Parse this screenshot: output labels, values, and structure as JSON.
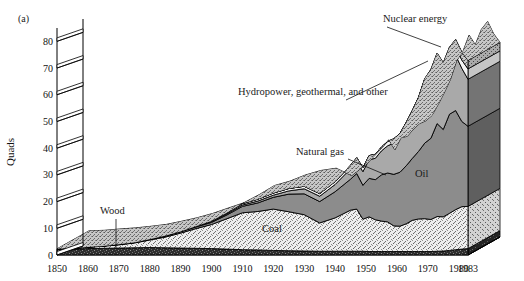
{
  "figure": {
    "panel_label": "(a)",
    "y_axis_title": "Quads",
    "background": "#ffffff",
    "ink": "#000000"
  },
  "chart_data": {
    "type": "area",
    "stacked": true,
    "title": "",
    "subtitle": "",
    "xlabel": "",
    "ylabel": "Quads",
    "xlim": [
      1850,
      1983
    ],
    "ylim": [
      0,
      85
    ],
    "ytick_values": [
      0,
      10,
      20,
      30,
      40,
      50,
      60,
      70,
      80
    ],
    "ytick_labels": [
      "0",
      "10",
      "20",
      "30",
      "40",
      "50",
      "60",
      "70",
      "80"
    ],
    "xtick_values": [
      1850,
      1860,
      1870,
      1880,
      1890,
      1900,
      1910,
      1920,
      1930,
      1940,
      1950,
      1960,
      1970,
      1980,
      1983
    ],
    "xtick_labels": [
      "1850",
      "1860",
      "1870",
      "1880",
      "1890",
      "1900",
      "1910",
      "1920",
      "1930",
      "1940",
      "1950",
      "1960",
      "1970",
      "1980",
      "1983"
    ],
    "grid": false,
    "legend_position": "inline-annotations",
    "projection": "3d-extruded-ribbon",
    "x": [
      1850,
      1855,
      1860,
      1865,
      1870,
      1875,
      1880,
      1885,
      1890,
      1895,
      1900,
      1905,
      1910,
      1915,
      1920,
      1925,
      1930,
      1935,
      1940,
      1945,
      1947,
      1949,
      1951,
      1953,
      1955,
      1957,
      1959,
      1961,
      1963,
      1965,
      1967,
      1969,
      1971,
      1973,
      1975,
      1977,
      1979,
      1981,
      1983
    ],
    "series": [
      {
        "name": "Wood",
        "fill": "#3a3a3a",
        "texture": "dark-fine-speckle",
        "values": [
          2.1,
          2.2,
          2.4,
          2.5,
          2.6,
          2.7,
          2.8,
          2.7,
          2.6,
          2.5,
          2.4,
          2.2,
          2.0,
          1.9,
          1.7,
          1.6,
          1.5,
          1.4,
          1.4,
          1.4,
          1.4,
          1.4,
          1.3,
          1.3,
          1.3,
          1.3,
          1.3,
          1.3,
          1.3,
          1.3,
          1.3,
          1.3,
          1.3,
          1.4,
          1.5,
          1.7,
          2.0,
          2.2,
          2.4
        ]
      },
      {
        "name": "Coal",
        "fill": "#e3e3e3",
        "texture": "light-stipple",
        "values": [
          0.2,
          0.3,
          0.5,
          0.8,
          1.2,
          1.8,
          2.8,
          4.0,
          5.6,
          7.4,
          9.0,
          11.4,
          13.8,
          14.4,
          15.5,
          14.6,
          13.6,
          10.6,
          12.5,
          15.4,
          15.8,
          12.0,
          13.0,
          11.9,
          11.4,
          11.1,
          9.6,
          9.5,
          10.4,
          11.7,
          12.2,
          12.3,
          12.0,
          13.0,
          12.8,
          13.9,
          15.0,
          15.9,
          15.8
        ]
      },
      {
        "name": "Oil",
        "fill": "#8c8c8c",
        "texture": "solid-mid-gray",
        "values": [
          0.0,
          0.0,
          0.1,
          0.1,
          0.2,
          0.2,
          0.3,
          0.4,
          0.5,
          0.6,
          0.8,
          1.4,
          2.4,
          3.2,
          4.4,
          6.6,
          7.8,
          8.0,
          9.8,
          11.6,
          13.3,
          12.7,
          14.4,
          15.0,
          17.3,
          18.3,
          19.3,
          20.2,
          21.7,
          23.2,
          25.3,
          28.3,
          30.4,
          34.8,
          32.7,
          37.1,
          37.1,
          31.9,
          30.0
        ]
      },
      {
        "name": "Natural gas",
        "fill": "#a9a9a9",
        "texture": "solid-light-gray",
        "values": [
          0.0,
          0.0,
          0.0,
          0.0,
          0.0,
          0.0,
          0.0,
          0.1,
          0.1,
          0.2,
          0.3,
          0.4,
          0.5,
          0.7,
          0.8,
          1.2,
          1.9,
          2.0,
          2.7,
          3.9,
          4.5,
          5.1,
          7.0,
          8.0,
          9.0,
          10.2,
          11.7,
          12.9,
          14.4,
          15.8,
          17.9,
          21.3,
          22.5,
          22.5,
          19.9,
          19.9,
          20.7,
          19.9,
          17.6
        ]
      },
      {
        "name": "Hydropower, geothermal, and other",
        "fill": "#f2f2f2",
        "texture": "near-white",
        "values": [
          0.0,
          0.0,
          0.0,
          0.0,
          0.0,
          0.0,
          0.0,
          0.0,
          0.0,
          0.1,
          0.25,
          0.4,
          0.55,
          0.7,
          0.8,
          0.9,
          0.95,
          1.0,
          1.1,
          1.3,
          1.4,
          1.4,
          1.5,
          1.5,
          1.4,
          1.6,
          1.6,
          1.6,
          1.8,
          2.1,
          2.3,
          2.7,
          2.9,
          3.0,
          3.2,
          2.5,
          3.1,
          3.1,
          3.9
        ]
      },
      {
        "name": "Nuclear energy",
        "fill": "#cfcfcf",
        "texture": "coarse-stipple",
        "values": [
          0,
          0,
          0,
          0,
          0,
          0,
          0,
          0,
          0,
          0,
          0,
          0,
          0,
          0,
          0,
          0,
          0,
          0,
          0,
          0,
          0,
          0,
          0,
          0,
          0,
          0,
          0.02,
          0.03,
          0.04,
          0.04,
          0.09,
          0.15,
          0.4,
          0.9,
          1.9,
          2.7,
          2.8,
          3.0,
          3.2
        ]
      }
    ],
    "annotations": [
      {
        "id": "ann-nuclear",
        "text": "Nuclear energy",
        "x": 383,
        "y": 22,
        "lx1": 387,
        "ly1": 27,
        "lx2": 441,
        "ly2": 47
      },
      {
        "id": "ann-hydro",
        "text": "Hydropower, geothermal, and other",
        "x": 238,
        "y": 95,
        "lx1": 346,
        "ly1": 100,
        "lx2": 428,
        "ly2": 61
      },
      {
        "id": "ann-natgas",
        "text": "Natural gas",
        "x": 296,
        "y": 155,
        "lx1": 348,
        "ly1": 159,
        "lx2": 386,
        "ly2": 175
      },
      {
        "id": "ann-oil",
        "text": "Oil",
        "x": 415,
        "y": 177,
        "lx1": null,
        "ly1": null,
        "lx2": null,
        "ly2": null
      },
      {
        "id": "ann-coal",
        "text": "Coal",
        "x": 262,
        "y": 232,
        "lx1": null,
        "ly1": null,
        "lx2": null,
        "ly2": null
      },
      {
        "id": "ann-wood",
        "text": "Wood",
        "x": 100,
        "y": 214,
        "lx1": 116,
        "ly1": 219,
        "lx2": 116,
        "ly2": 249
      }
    ]
  }
}
